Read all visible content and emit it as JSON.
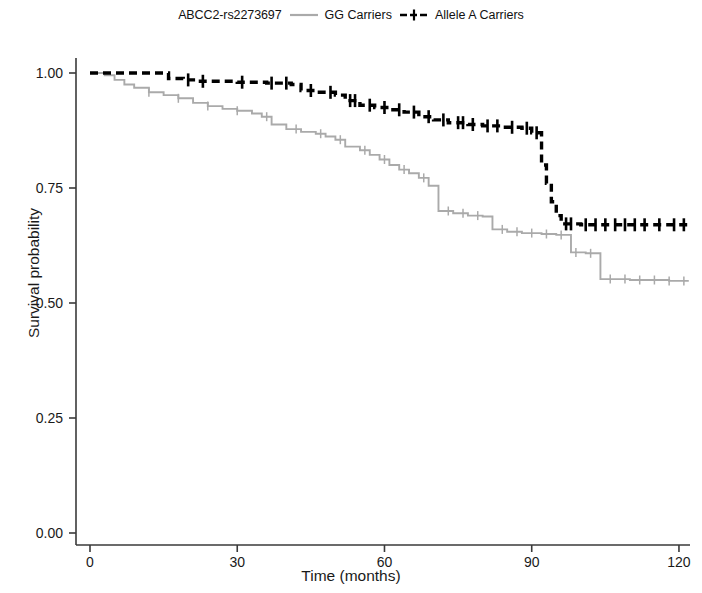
{
  "legend": {
    "title": "ABCC2-rs2273697",
    "entries": [
      {
        "label": "GG Carriers",
        "color": "#aaaaaa",
        "style": "solid",
        "key_name": "legend-key-gg-carriers"
      },
      {
        "label": "Allele A Carriers",
        "color": "#000000",
        "style": "dashed",
        "key_name": "legend-key-allele-a-carriers"
      }
    ]
  },
  "axes": {
    "x_title": "Time (months)",
    "y_title": "Survival probability",
    "x_ticks": [
      "0",
      "30",
      "60",
      "90",
      "120"
    ],
    "y_ticks": [
      "0.00",
      "0.25",
      "0.50",
      "0.75",
      "1.00"
    ]
  },
  "chart_data": {
    "type": "line",
    "subtype": "kaplan-meier-survival",
    "title": "",
    "xlabel": "Time (months)",
    "ylabel": "Survival probability",
    "xlim": [
      0,
      124
    ],
    "ylim": [
      0.0,
      1.0
    ],
    "xticks": [
      0,
      30,
      60,
      90,
      120
    ],
    "yticks": [
      0.0,
      0.25,
      0.5,
      0.75,
      1.0
    ],
    "grid": false,
    "legend_position": "top-center",
    "legend_title": "ABCC2-rs2273697",
    "series": [
      {
        "name": "GG Carriers",
        "color": "#aaaaaa",
        "linestyle": "solid",
        "points": [
          [
            0,
            1.0
          ],
          [
            3,
            0.995
          ],
          [
            5,
            0.985
          ],
          [
            7,
            0.975
          ],
          [
            9,
            0.968
          ],
          [
            12,
            0.958
          ],
          [
            15,
            0.952
          ],
          [
            18,
            0.945
          ],
          [
            21,
            0.935
          ],
          [
            24,
            0.928
          ],
          [
            27,
            0.922
          ],
          [
            30,
            0.918
          ],
          [
            33,
            0.912
          ],
          [
            35,
            0.905
          ],
          [
            37,
            0.888
          ],
          [
            40,
            0.878
          ],
          [
            43,
            0.872
          ],
          [
            46,
            0.868
          ],
          [
            48,
            0.862
          ],
          [
            50,
            0.855
          ],
          [
            52,
            0.84
          ],
          [
            55,
            0.832
          ],
          [
            57,
            0.822
          ],
          [
            59,
            0.812
          ],
          [
            61,
            0.8
          ],
          [
            63,
            0.79
          ],
          [
            65,
            0.782
          ],
          [
            67,
            0.772
          ],
          [
            69,
            0.755
          ],
          [
            71,
            0.7
          ],
          [
            74,
            0.695
          ],
          [
            77,
            0.69
          ],
          [
            80,
            0.688
          ],
          [
            82,
            0.66
          ],
          [
            85,
            0.655
          ],
          [
            88,
            0.652
          ],
          [
            92,
            0.65
          ],
          [
            95,
            0.648
          ],
          [
            98,
            0.61
          ],
          [
            101,
            0.608
          ],
          [
            104,
            0.552
          ],
          [
            110,
            0.55
          ],
          [
            118,
            0.548
          ],
          [
            122,
            0.548
          ]
        ],
        "censor_times": [
          12,
          18,
          24,
          30,
          36,
          42,
          47,
          51,
          56,
          60,
          64,
          68,
          73,
          76,
          79,
          84,
          87,
          90,
          93,
          96,
          99,
          102,
          106,
          109,
          112,
          115,
          118,
          121
        ]
      },
      {
        "name": "Allele A Carriers",
        "color": "#000000",
        "linestyle": "dashed",
        "points": [
          [
            0,
            1.0
          ],
          [
            14,
            1.0
          ],
          [
            16,
            0.988
          ],
          [
            19,
            0.985
          ],
          [
            22,
            0.982
          ],
          [
            30,
            0.98
          ],
          [
            36,
            0.978
          ],
          [
            41,
            0.975
          ],
          [
            43,
            0.962
          ],
          [
            46,
            0.958
          ],
          [
            50,
            0.952
          ],
          [
            52,
            0.94
          ],
          [
            55,
            0.93
          ],
          [
            58,
            0.925
          ],
          [
            61,
            0.92
          ],
          [
            64,
            0.915
          ],
          [
            67,
            0.905
          ],
          [
            70,
            0.898
          ],
          [
            73,
            0.892
          ],
          [
            77,
            0.888
          ],
          [
            80,
            0.885
          ],
          [
            84,
            0.882
          ],
          [
            88,
            0.88
          ],
          [
            90,
            0.87
          ],
          [
            92,
            0.8
          ],
          [
            93,
            0.76
          ],
          [
            94,
            0.72
          ],
          [
            95,
            0.69
          ],
          [
            96,
            0.672
          ],
          [
            100,
            0.67
          ],
          [
            108,
            0.67
          ],
          [
            116,
            0.67
          ],
          [
            122,
            0.67
          ]
        ],
        "censor_times": [
          20,
          23,
          31,
          37,
          40,
          45,
          49,
          53,
          54,
          57,
          60,
          63,
          66,
          69,
          72,
          75,
          76,
          78,
          81,
          83,
          86,
          89,
          91,
          97,
          98,
          101,
          103,
          105,
          107,
          109,
          111,
          113,
          116,
          119,
          121
        ]
      }
    ]
  },
  "plot_geometry": {
    "x0_px": 90,
    "x_per_unit_px": 4.908,
    "y1_px": 73,
    "y0_px": 533,
    "plot_right_px": 686
  }
}
